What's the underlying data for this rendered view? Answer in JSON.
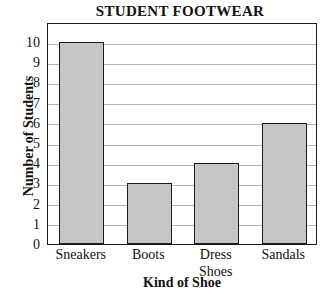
{
  "chart_data": {
    "type": "bar",
    "title": "STUDENT FOOTWEAR",
    "xlabel": "Kind of Shoe",
    "ylabel": "Number of Students",
    "categories": [
      "Sneakers",
      "Boots",
      "Dress Shoes",
      "Sandals"
    ],
    "category_lines": [
      [
        "Sneakers"
      ],
      [
        "Boots"
      ],
      [
        "Dress",
        "Shoes"
      ],
      [
        "Sandals"
      ]
    ],
    "values": [
      10,
      3,
      4,
      6
    ],
    "ylim": [
      0,
      10
    ],
    "ytick_labels": [
      "0",
      "1",
      "2",
      "3",
      "4",
      "5",
      "6",
      "7",
      "8",
      "9",
      "10"
    ],
    "ytick_values": [
      0,
      1,
      2,
      3,
      4,
      5,
      6,
      7,
      8,
      9,
      10
    ],
    "grid": true,
    "legend": "none",
    "bar_color": "#c6c6c6",
    "bar_edge_color": "#1a1a1a",
    "grid_color": "#b4b4b4",
    "axis_color": "#1a1a1a",
    "background_color": "#ffffff"
  }
}
